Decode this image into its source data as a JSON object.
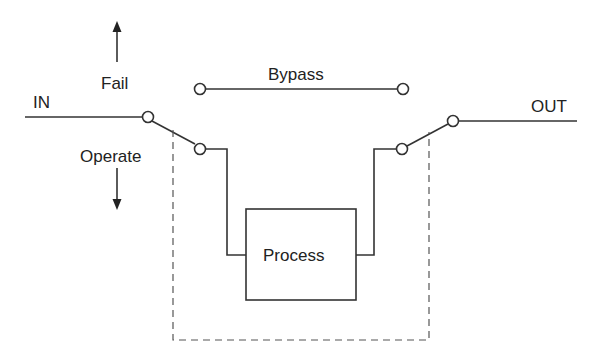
{
  "diagram": {
    "type": "bypass switch schematic",
    "labels": {
      "input": "IN",
      "output": "OUT",
      "bypass": "Bypass",
      "process": "Process",
      "fail": "Fail",
      "operate": "Operate"
    },
    "arrows": [
      {
        "label": "Fail",
        "direction": "up"
      },
      {
        "label": "Operate",
        "direction": "down"
      }
    ],
    "switches": [
      {
        "name": "input-switch",
        "common": "IN",
        "positions": [
          "Bypass",
          "Process"
        ],
        "current": "Process"
      },
      {
        "name": "output-switch",
        "common": "OUT",
        "positions": [
          "Bypass",
          "Process"
        ],
        "current": "Process"
      }
    ],
    "mechanical_link": "dashed line ganging both switches",
    "colors": {
      "stroke": "#333333",
      "text": "#222222",
      "background": "#ffffff"
    }
  }
}
